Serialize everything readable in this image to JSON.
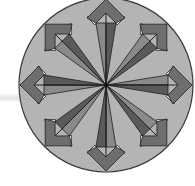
{
  "figure": {
    "center": [
      106,
      85
    ],
    "radius": 87,
    "arrow_count": 8,
    "arrow_angles_deg": [
      0,
      45,
      90,
      135,
      180,
      225,
      270,
      315
    ],
    "colors": {
      "disc_fill": "#b4b4b4",
      "disc_stroke": "#3a3a3a",
      "kite_fill": "#6e6e6e",
      "spoke_fill": "#5a5a5a",
      "spoke_light": "#8a8a8a",
      "notch_fill": "#ffffff",
      "line": "#1e1e1e"
    }
  }
}
